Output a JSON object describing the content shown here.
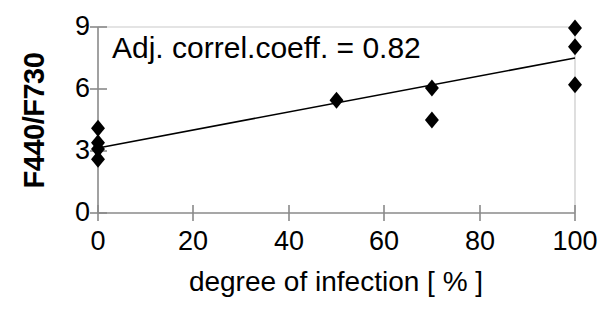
{
  "chart_data": {
    "type": "scatter",
    "title": "",
    "xlabel": "degree of infection [ % ]",
    "ylabel": "F440/F730",
    "xlim": [
      0,
      100
    ],
    "ylim": [
      0,
      9
    ],
    "xticks": [
      0,
      20,
      40,
      60,
      80,
      100
    ],
    "xtick_labels": [
      "0",
      "20",
      "40",
      "60",
      "80",
      "100"
    ],
    "yticks": [
      0,
      3,
      6,
      9
    ],
    "ytick_labels": [
      "0",
      "3",
      "6",
      "9"
    ],
    "grid": false,
    "legend": null,
    "marker": "diamond",
    "marker_color": "#000000",
    "annotations": [
      {
        "text": "Adj. correl.coeff. = 0.82",
        "x": 4,
        "y": 8.4
      }
    ],
    "points": [
      {
        "x": 0,
        "y": 4.1
      },
      {
        "x": 0,
        "y": 3.4
      },
      {
        "x": 0,
        "y": 3.1
      },
      {
        "x": 0,
        "y": 2.6
      },
      {
        "x": 50,
        "y": 5.45
      },
      {
        "x": 70,
        "y": 6.05
      },
      {
        "x": 70,
        "y": 4.5
      },
      {
        "x": 100,
        "y": 8.95
      },
      {
        "x": 100,
        "y": 8.05
      },
      {
        "x": 100,
        "y": 6.2
      }
    ],
    "trendline": {
      "name": "linear regression",
      "x": [
        0,
        100
      ],
      "y": [
        3.15,
        7.5
      ],
      "color": "#000000"
    }
  },
  "axis_titles": {
    "y": "F440/F730",
    "x": "degree of infection [ % ]"
  },
  "annotation_text": "Adj. correl.coeff. = 0.82"
}
